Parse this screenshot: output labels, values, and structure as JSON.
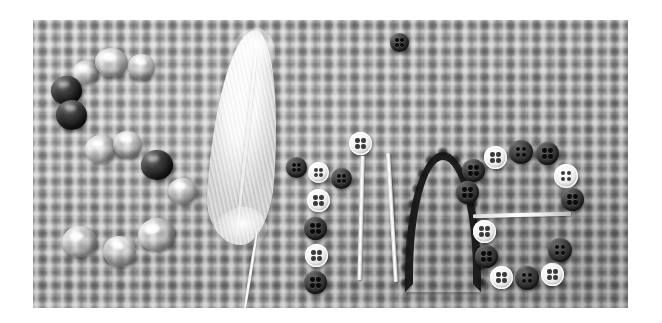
{
  "photo": {
    "subject_word": "Spring",
    "description": "The word Spring spelled out with craft materials on burlap fabric",
    "background_surface": "burlap basket-weave fabric",
    "color_mode": "grayscale",
    "canvas": {
      "width": 662,
      "height": 323,
      "background": "#ffffff"
    },
    "frame": {
      "left": 33,
      "top": 20,
      "width": 595,
      "height": 288
    },
    "palette": {
      "fabric_gray": "#a2a2a2",
      "dark_button": "#1a1a1a",
      "light_button": "#f2f2f2",
      "feather_white": "#fbfbfb",
      "page_white": "#ffffff"
    }
  },
  "letters": [
    {
      "glyph": "S",
      "material": "glass beads",
      "count": 11
    },
    {
      "glyph": "p",
      "material": "white feather",
      "count": 1
    },
    {
      "glyph": "r",
      "material": "buttons",
      "count": 6
    },
    {
      "glyph": "i",
      "material": "white sticks and button dot",
      "count": 3
    },
    {
      "glyph": "n",
      "material": "dark fuzzy yarn",
      "count": 1
    },
    {
      "glyph": "g",
      "material": "buttons and white stick",
      "count": 14
    }
  ],
  "beads": [
    {
      "x": 73,
      "y": 60,
      "w": 26,
      "h": 24,
      "tone": "clear",
      "rot": -12
    },
    {
      "x": 95,
      "y": 48,
      "w": 32,
      "h": 28,
      "tone": "clear",
      "rot": 6
    },
    {
      "x": 128,
      "y": 54,
      "w": 26,
      "h": 25,
      "tone": "clear",
      "rot": 14
    },
    {
      "x": 51,
      "y": 76,
      "w": 30,
      "h": 28,
      "tone": "dark",
      "rot": -6
    },
    {
      "x": 56,
      "y": 100,
      "w": 30,
      "h": 29,
      "tone": "dark",
      "rot": 8
    },
    {
      "x": 85,
      "y": 135,
      "w": 30,
      "h": 27,
      "tone": "clear",
      "rot": -4
    },
    {
      "x": 113,
      "y": 131,
      "w": 28,
      "h": 26,
      "tone": "clear",
      "rot": 12
    },
    {
      "x": 141,
      "y": 150,
      "w": 31,
      "h": 29,
      "tone": "dark",
      "rot": -9
    },
    {
      "x": 168,
      "y": 178,
      "w": 28,
      "h": 25,
      "tone": "clear",
      "rot": 5
    },
    {
      "x": 138,
      "y": 218,
      "w": 36,
      "h": 32,
      "tone": "clear",
      "rot": -10
    },
    {
      "x": 103,
      "y": 236,
      "w": 32,
      "h": 30,
      "tone": "clear",
      "rot": 16
    },
    {
      "x": 62,
      "y": 226,
      "w": 34,
      "h": 30,
      "tone": "clear",
      "rot": -3
    }
  ],
  "buttons": [
    {
      "x": 399,
      "y": 41,
      "d": 18,
      "tone": "dark",
      "label": "i-dot"
    },
    {
      "x": 297,
      "y": 168,
      "d": 21,
      "tone": "dark",
      "label": "r-1"
    },
    {
      "x": 318,
      "y": 172,
      "d": 21,
      "tone": "light",
      "label": "r-2"
    },
    {
      "x": 340,
      "y": 178,
      "d": 21,
      "tone": "dark",
      "label": "r-3"
    },
    {
      "x": 316,
      "y": 199,
      "d": 22,
      "tone": "light",
      "label": "r-4"
    },
    {
      "x": 313,
      "y": 227,
      "d": 22,
      "tone": "dark",
      "label": "r-5"
    },
    {
      "x": 314,
      "y": 254,
      "d": 22,
      "tone": "light",
      "label": "r-6"
    },
    {
      "x": 313,
      "y": 280,
      "d": 22,
      "tone": "dark",
      "label": "r-7"
    },
    {
      "x": 358,
      "y": 143,
      "d": 22,
      "tone": "light",
      "label": "i-top"
    },
    {
      "x": 489,
      "y": 155,
      "d": 22,
      "tone": "light",
      "label": "g-1"
    },
    {
      "x": 513,
      "y": 148,
      "d": 23,
      "tone": "dark",
      "label": "g-2"
    },
    {
      "x": 540,
      "y": 150,
      "d": 22,
      "tone": "dark",
      "label": "g-3"
    },
    {
      "x": 559,
      "y": 172,
      "d": 23,
      "tone": "light",
      "label": "g-4"
    },
    {
      "x": 566,
      "y": 196,
      "d": 22,
      "tone": "dark",
      "label": "g-5"
    },
    {
      "x": 467,
      "y": 168,
      "d": 22,
      "tone": "dark",
      "label": "g-6"
    },
    {
      "x": 461,
      "y": 190,
      "d": 22,
      "tone": "dark",
      "label": "g-7"
    },
    {
      "x": 478,
      "y": 222,
      "d": 22,
      "tone": "light",
      "label": "g-8"
    },
    {
      "x": 480,
      "y": 247,
      "d": 22,
      "tone": "dark",
      "label": "g-9"
    },
    {
      "x": 495,
      "y": 268,
      "d": 22,
      "tone": "light",
      "label": "g-10"
    },
    {
      "x": 520,
      "y": 268,
      "d": 23,
      "tone": "dark",
      "label": "g-11"
    },
    {
      "x": 546,
      "y": 265,
      "d": 22,
      "tone": "light",
      "label": "g-12"
    },
    {
      "x": 553,
      "y": 240,
      "d": 23,
      "tone": "dark",
      "label": "g-13"
    }
  ],
  "sticks": [
    {
      "x": 364,
      "y": 165,
      "w": 4,
      "h": 125,
      "rot": 1.5,
      "label": "i-stem-left"
    },
    {
      "x": 395,
      "y": 162,
      "w": 4,
      "h": 130,
      "rot": -3.5,
      "label": "i-stem-right"
    },
    {
      "x": 478,
      "y": 215,
      "w": 96,
      "h": 4,
      "rot": -1.5,
      "label": "g-crossbar"
    }
  ],
  "yarn": {
    "x": 410,
    "y": 158,
    "w": 72,
    "h": 130,
    "label": "n-arch"
  },
  "feather": {
    "x": 205,
    "y": 30,
    "w": 78,
    "h": 235,
    "label": "p-feather"
  }
}
